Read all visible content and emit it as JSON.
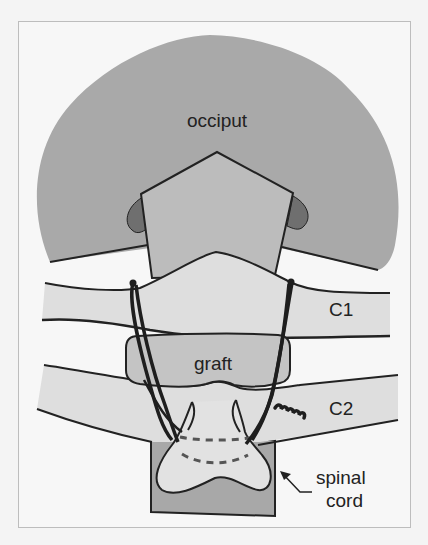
{
  "figure": {
    "type": "anatomical-diagram",
    "labels": {
      "occiput": "occiput",
      "c1": "C1",
      "graft": "graft",
      "c2": "C2",
      "spinal_cord_line1": "spinal",
      "spinal_cord_line2": "cord"
    },
    "colors": {
      "occiput_fill": "#a9a9a9",
      "occiput_notch_fill": "#6f6f6f",
      "foramen_fill": "#bcbcbc",
      "vertebra_fill": "#dedede",
      "graft_fill": "#c4c4c4",
      "spinal_canal_fill": "#a8a8a8",
      "cord_fill": "#e2e2e2",
      "outline": "#222222",
      "wire": "#1e1e1e",
      "background": "#f7f7f7"
    }
  }
}
